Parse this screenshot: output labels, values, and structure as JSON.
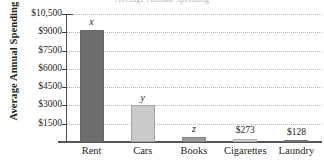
{
  "figure": {
    "cropped_title": "Average Annual Spending",
    "axis_color": "#4a4a4c",
    "grid_color": "#b5b5bb",
    "background": "#ffffff"
  },
  "chart_data": {
    "type": "bar",
    "title": "Average Annual Spending",
    "xlabel": "",
    "ylabel": "Average Annual Spending",
    "categories": [
      "Rent",
      "Cars",
      "Books",
      "Cigarettes",
      "Laundry"
    ],
    "values": [
      9200,
      3000,
      450,
      273,
      128
    ],
    "point_labels": [
      "x",
      "y",
      "z",
      "$273",
      "$128"
    ],
    "point_label_styles": [
      "italic",
      "italic",
      "italic",
      "normal",
      "normal"
    ],
    "bar_colors": [
      "#6e6e6e",
      "#c9c9c9",
      "#9a9a9a",
      "#d7d7d7",
      "#7e7e7e"
    ],
    "ylim": [
      0,
      10500
    ],
    "ytick_values": [
      1500,
      3000,
      4500,
      6000,
      7500,
      9000,
      10500
    ],
    "ytick_labels": [
      "$1500",
      "$3000",
      "$4500",
      "$6000",
      "$7500",
      "$9000",
      "$10,500"
    ],
    "grid": "horizontal-dotted",
    "legend": "none"
  }
}
